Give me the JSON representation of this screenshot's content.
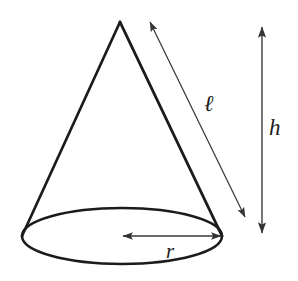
{
  "figure": {
    "shape": "cone",
    "background_color": "#ffffff",
    "outline_color": "#1b1b1b",
    "dimension_line_color": "#3a3a3a"
  },
  "labels": {
    "slant_height": "ℓ",
    "height": "h",
    "radius": "r"
  },
  "geometry": {
    "apex": {
      "x": 120,
      "y": 22
    },
    "base_ellipse": {
      "cx": 122,
      "cy": 236,
      "rx": 100,
      "ry": 28
    },
    "base_left": {
      "x": 22,
      "y": 236
    },
    "base_right": {
      "x": 222,
      "y": 236
    },
    "slant_arrow": {
      "x1": 150,
      "y1": 20,
      "x2": 246,
      "y2": 219
    },
    "height_arrow": {
      "x1": 262,
      "y1": 25,
      "x2": 262,
      "y2": 235
    },
    "radius_arrow": {
      "x1": 122,
      "y1": 236,
      "x2": 222,
      "y2": 236
    }
  }
}
